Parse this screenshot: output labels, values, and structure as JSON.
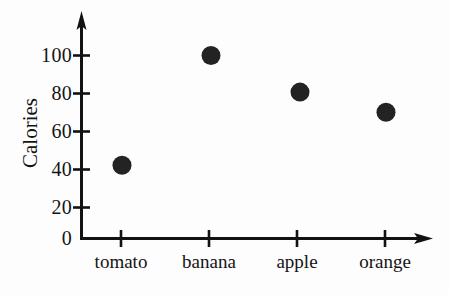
{
  "chart_data": {
    "type": "scatter",
    "title": "",
    "xlabel": "",
    "ylabel": "Calories",
    "categories": [
      "tomato",
      "banana",
      "apple",
      "orange"
    ],
    "values": [
      40,
      100,
      80,
      69
    ],
    "series": [
      {
        "name": "Calories",
        "values": [
          40,
          100,
          80,
          69
        ]
      }
    ],
    "points": [
      {
        "category": "tomato",
        "value": 40
      },
      {
        "category": "banana",
        "value": 100
      },
      {
        "category": "apple",
        "value": 80
      },
      {
        "category": "orange",
        "value": 69
      }
    ],
    "ylim": [
      0,
      110
    ],
    "yticks": [
      0,
      20,
      40,
      60,
      80,
      100
    ],
    "ytick_labels": [
      "0",
      "20",
      "40",
      "60",
      "80",
      "100"
    ],
    "xtick_labels": [
      "tomato",
      "banana",
      "apple",
      "orange"
    ],
    "grid": false,
    "legend": false,
    "legend_position": "none",
    "marker": "filled-circle",
    "marker_color": "#1c1c1c",
    "axis_color": "#121212",
    "axis_style": "arrow-ended",
    "background_color": "#fdfdfd"
  },
  "axes": {
    "y": {
      "label": "Calories",
      "ticks": [
        {
          "label": "100",
          "value": 100
        },
        {
          "label": "80",
          "value": 80
        },
        {
          "label": "60",
          "value": 60
        },
        {
          "label": "40",
          "value": 40
        },
        {
          "label": "20",
          "value": 20
        },
        {
          "label": "0",
          "value": 0
        }
      ]
    },
    "x": {
      "label": "",
      "ticks": [
        {
          "label": "tomato"
        },
        {
          "label": "banana"
        },
        {
          "label": "apple"
        },
        {
          "label": "orange"
        }
      ]
    }
  }
}
